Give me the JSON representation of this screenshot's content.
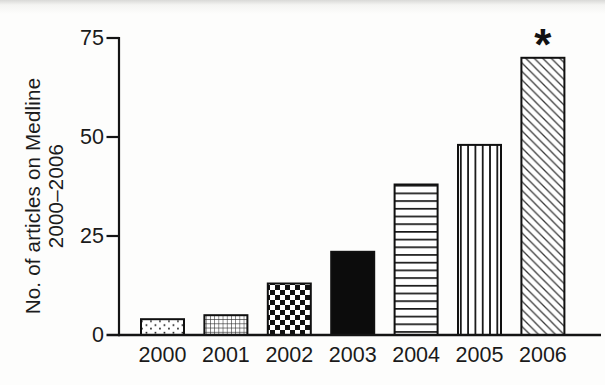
{
  "chart_data": {
    "type": "bar",
    "title": "",
    "categories": [
      "2000",
      "2001",
      "2002",
      "2003",
      "2004",
      "2005",
      "2006"
    ],
    "values": [
      4,
      5,
      13,
      21,
      38,
      48,
      70
    ],
    "fill_patterns": [
      "dots",
      "fine-grid",
      "checkerboard",
      "solid",
      "horizontal-lines",
      "vertical-lines",
      "diagonal-lines"
    ],
    "ylabel_line1": "No. of articles on Medline",
    "ylabel_line2": "2000–2006",
    "xlabel": "",
    "yticks": [
      0,
      25,
      50,
      75
    ],
    "ylim": [
      0,
      75
    ],
    "grid": false,
    "legend": false,
    "annotation": {
      "text": "*",
      "category": "2006"
    },
    "colors": {
      "ink": "#141414",
      "bar_outline": "#101010",
      "background": "#fdfdfc"
    }
  }
}
